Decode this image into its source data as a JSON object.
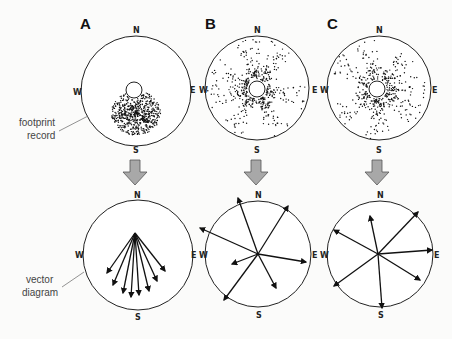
{
  "panels": [
    {
      "id": "A",
      "label": "A"
    },
    {
      "id": "B",
      "label": "B"
    },
    {
      "id": "C",
      "label": "C"
    }
  ],
  "compass": {
    "n": "N",
    "s": "S",
    "e": "E",
    "w": "W"
  },
  "captions": {
    "footprint_line1": "footprint",
    "footprint_line2": "record",
    "vector_line1": "vector",
    "vector_line2": "diagram"
  },
  "colors": {
    "arrow_fill": "#a8a8a8",
    "arrow_stroke": "#555555",
    "ink": "#111111",
    "background": "#fbfbfa"
  },
  "vectors": {
    "A": [
      [
        -28,
        40
      ],
      [
        -22,
        52
      ],
      [
        -12,
        60
      ],
      [
        -4,
        64
      ],
      [
        4,
        62
      ],
      [
        14,
        58
      ],
      [
        22,
        48
      ],
      [
        30,
        38
      ]
    ],
    "B": [
      [
        -20,
        -56
      ],
      [
        -58,
        -26
      ],
      [
        30,
        -48
      ],
      [
        48,
        8
      ],
      [
        -26,
        10
      ],
      [
        -34,
        46
      ],
      [
        18,
        34
      ]
    ],
    "C": [
      [
        -8,
        -38
      ],
      [
        -44,
        -24
      ],
      [
        40,
        -42
      ],
      [
        54,
        -4
      ],
      [
        -44,
        32
      ],
      [
        42,
        26
      ],
      [
        4,
        54
      ]
    ]
  }
}
